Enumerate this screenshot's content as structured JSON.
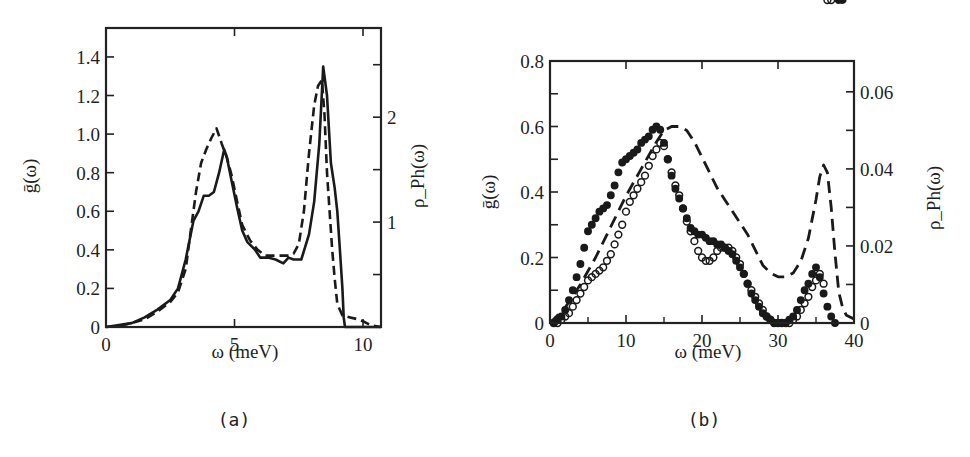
{
  "figure": {
    "panels": [
      {
        "id": "a",
        "panel_label": "(a)",
        "xlabel": "ω (meV)",
        "ylabel_left": "ḡ(ω)",
        "ylabel_right": "ρ_Ph(ω)",
        "x_ticks": [
          "0",
          "5",
          "10"
        ],
        "y_left_ticks": [
          "0",
          "0.2",
          "0.4",
          "0.6",
          "0.8",
          "1.0",
          "1.2",
          "1.4"
        ],
        "y_right_ticks": [
          "1",
          "2"
        ]
      },
      {
        "id": "b",
        "panel_label": "(b)",
        "xlabel": "ω (meV)",
        "ylabel_left": "ḡ(ω)",
        "ylabel_right": "ρ_Ph(ω)",
        "x_ticks": [
          "0",
          "10",
          "20",
          "30",
          "40"
        ],
        "y_left_ticks": [
          "0",
          "0.2",
          "0.4",
          "0.6",
          "0.8"
        ],
        "y_right_ticks": [
          "0",
          "0.02",
          "0.04",
          "0.06"
        ]
      }
    ]
  },
  "chart_data": [
    {
      "type": "line",
      "title": "(a)",
      "xlabel": "ω (meV)",
      "ylabel": "ḡ(ω)",
      "ylabel_right": "ρ_Ph(ω)",
      "xlim": [
        0,
        10.7
      ],
      "ylim": [
        0,
        1.55
      ],
      "ylim_right": [
        0,
        2.85
      ],
      "x_ticks": [
        0,
        5,
        10
      ],
      "y_ticks": [
        0,
        0.2,
        0.4,
        0.6,
        0.8,
        1.0,
        1.2,
        1.4
      ],
      "y_right_ticks": [
        1,
        2
      ],
      "grid": false,
      "legend": null,
      "series": [
        {
          "name": "ḡ(ω) (solid)",
          "style": "solid",
          "axis": "left",
          "x": [
            0,
            0.5,
            1.0,
            1.5,
            2.0,
            2.5,
            2.8,
            3.1,
            3.4,
            3.6,
            3.8,
            4.0,
            4.2,
            4.4,
            4.6,
            4.7,
            4.9,
            5.1,
            5.3,
            5.5,
            5.8,
            6.0,
            6.3,
            6.6,
            6.9,
            7.1,
            7.3,
            7.6,
            7.9,
            8.1,
            8.3,
            8.45,
            8.6,
            8.75,
            8.9,
            9.0,
            9.1,
            9.2,
            9.25,
            9.3,
            10.7
          ],
          "y": [
            0,
            0.01,
            0.02,
            0.05,
            0.09,
            0.14,
            0.2,
            0.35,
            0.55,
            0.6,
            0.68,
            0.68,
            0.7,
            0.8,
            0.92,
            0.88,
            0.75,
            0.62,
            0.5,
            0.44,
            0.4,
            0.36,
            0.36,
            0.35,
            0.33,
            0.36,
            0.35,
            0.35,
            0.48,
            0.65,
            0.95,
            1.35,
            1.2,
            0.85,
            0.72,
            0.6,
            0.4,
            0.2,
            0.05,
            0,
            0
          ]
        },
        {
          "name": "ρ_Ph(ω) (dashed)",
          "style": "dashed",
          "axis": "left-scaled",
          "x": [
            0,
            0.5,
            1.0,
            1.5,
            2.0,
            2.5,
            2.8,
            3.1,
            3.3,
            3.5,
            3.7,
            3.9,
            4.1,
            4.3,
            4.5,
            4.7,
            4.9,
            5.1,
            5.3,
            5.6,
            5.9,
            6.2,
            6.5,
            6.8,
            7.1,
            7.3,
            7.5,
            7.7,
            7.9,
            8.1,
            8.25,
            8.4,
            8.5,
            8.6,
            8.7,
            8.8,
            8.9,
            9.0,
            9.2,
            9.5,
            9.8,
            10.0,
            10.3,
            10.7
          ],
          "y": [
            0,
            0.005,
            0.02,
            0.04,
            0.08,
            0.13,
            0.18,
            0.3,
            0.5,
            0.7,
            0.85,
            0.92,
            0.98,
            1.03,
            0.95,
            0.88,
            0.78,
            0.65,
            0.53,
            0.45,
            0.4,
            0.37,
            0.37,
            0.37,
            0.37,
            0.38,
            0.43,
            0.6,
            0.9,
            1.15,
            1.25,
            1.28,
            1.1,
            0.8,
            0.6,
            0.4,
            0.25,
            0.12,
            0.06,
            0.05,
            0.04,
            0.03,
            0.01,
            0
          ]
        }
      ]
    },
    {
      "type": "line",
      "title": "(b)",
      "xlabel": "ω (meV)",
      "ylabel": "ḡ(ω)",
      "ylabel_right": "ρ_Ph(ω)",
      "xlim": [
        0,
        40
      ],
      "ylim": [
        0,
        0.8
      ],
      "ylim_right": [
        0,
        0.068
      ],
      "x_ticks": [
        0,
        10,
        20,
        30,
        40
      ],
      "y_ticks": [
        0,
        0.2,
        0.4,
        0.6,
        0.8
      ],
      "y_right_ticks": [
        0,
        0.02,
        0.04,
        0.06
      ],
      "grid": false,
      "legend": null,
      "series": [
        {
          "name": "filled circles",
          "style": "filled-markers",
          "axis": "left",
          "x": [
            0.5,
            1,
            1.5,
            2,
            2.5,
            3,
            3.5,
            4,
            4.5,
            5,
            5.5,
            6,
            6.5,
            7,
            7.5,
            8,
            8.5,
            9,
            9.5,
            10,
            10.5,
            11,
            11.5,
            12,
            12.5,
            13,
            13.5,
            14,
            14.5,
            15,
            15.5,
            16,
            16.5,
            17,
            17.5,
            18,
            18.5,
            19,
            19.5,
            20,
            20.5,
            21,
            21.5,
            22,
            22.5,
            23,
            23.5,
            24,
            24.5,
            25,
            25.5,
            26,
            26.5,
            27,
            27.5,
            28,
            28.5,
            29,
            29.5,
            30,
            30.5,
            31,
            31.5,
            32,
            32.5,
            33,
            33.5,
            34,
            34.5,
            35,
            35.5,
            36,
            36.5,
            37,
            37.5,
            38,
            38.5
          ],
          "y": [
            0.0,
            0.01,
            0.02,
            0.04,
            0.07,
            0.1,
            0.14,
            0.18,
            0.23,
            0.28,
            0.3,
            0.32,
            0.34,
            0.35,
            0.36,
            0.39,
            0.42,
            0.46,
            0.49,
            0.5,
            0.51,
            0.52,
            0.53,
            0.55,
            0.56,
            0.57,
            0.59,
            0.6,
            0.59,
            0.55,
            0.5,
            0.45,
            0.41,
            0.38,
            0.35,
            0.32,
            0.29,
            0.28,
            0.27,
            0.27,
            0.26,
            0.25,
            0.25,
            0.24,
            0.24,
            0.23,
            0.22,
            0.21,
            0.19,
            0.17,
            0.15,
            0.12,
            0.09,
            0.07,
            0.05,
            0.03,
            0.02,
            0.01,
            0.0,
            0.0,
            0.0,
            0.0,
            0.01,
            0.02,
            0.04,
            0.07,
            0.1,
            0.12,
            0.15,
            0.17,
            0.14,
            0.09,
            0.05,
            0.02,
            0.0
          ]
        },
        {
          "name": "open circles",
          "style": "open-markers",
          "axis": "left",
          "x": [
            0.5,
            1,
            1.5,
            2,
            2.5,
            3,
            3.5,
            4,
            4.5,
            5,
            5.5,
            6,
            6.5,
            7,
            7.5,
            8,
            8.5,
            9,
            9.5,
            10,
            10.5,
            11,
            11.5,
            12,
            12.5,
            13,
            13.5,
            14,
            14.5,
            15,
            15.5,
            16,
            16.5,
            17,
            17.5,
            18,
            18.5,
            19,
            19.5,
            20,
            20.5,
            21,
            21.5,
            22,
            22.5,
            23,
            23.5,
            24,
            24.5,
            25,
            25.5,
            26,
            26.5,
            27,
            27.5,
            28,
            28.5,
            29,
            29.5,
            30,
            30.5,
            31,
            31.5,
            32,
            32.5,
            33,
            33.5,
            34,
            34.5,
            35,
            35.5,
            36,
            36.5,
            37
          ],
          "y": [
            0.0,
            0.0,
            0.01,
            0.02,
            0.03,
            0.05,
            0.07,
            0.09,
            0.11,
            0.13,
            0.14,
            0.15,
            0.16,
            0.17,
            0.19,
            0.21,
            0.24,
            0.27,
            0.3,
            0.34,
            0.37,
            0.39,
            0.41,
            0.43,
            0.45,
            0.48,
            0.51,
            0.53,
            0.55,
            0.54,
            0.5,
            0.46,
            0.42,
            0.39,
            0.35,
            0.31,
            0.28,
            0.25,
            0.22,
            0.2,
            0.19,
            0.19,
            0.2,
            0.22,
            0.23,
            0.23,
            0.23,
            0.22,
            0.2,
            0.18,
            0.15,
            0.12,
            0.1,
            0.08,
            0.06,
            0.04,
            0.02,
            0.01,
            0.0,
            0.0,
            0.0,
            0.0,
            0.0,
            0.01,
            0.02,
            0.04,
            0.06,
            0.08,
            0.11,
            0.13,
            0.15,
            0.12
          ]
        },
        {
          "name": "ρ_Ph(ω) (dashed)",
          "style": "dashed",
          "axis": "right",
          "x": [
            0,
            2,
            4,
            6,
            8,
            10,
            12,
            14,
            15,
            16,
            17,
            18,
            19,
            20,
            21,
            22,
            23,
            24,
            25,
            26,
            27,
            28,
            29,
            30,
            31,
            32,
            33,
            34,
            35,
            35.5,
            36,
            36.5,
            37,
            37.5,
            38,
            38.5,
            39,
            40
          ],
          "y": [
            0,
            0.004,
            0.01,
            0.017,
            0.025,
            0.033,
            0.04,
            0.047,
            0.05,
            0.051,
            0.051,
            0.05,
            0.047,
            0.043,
            0.039,
            0.035,
            0.032,
            0.029,
            0.026,
            0.023,
            0.019,
            0.015,
            0.013,
            0.012,
            0.012,
            0.013,
            0.016,
            0.022,
            0.032,
            0.038,
            0.041,
            0.039,
            0.03,
            0.018,
            0.008,
            0.004,
            0.002,
            0.001
          ]
        }
      ]
    }
  ]
}
